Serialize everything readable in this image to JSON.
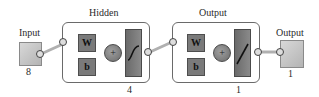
{
  "input": {
    "label": "Input",
    "size": "8"
  },
  "layers": [
    {
      "title": "Hidden",
      "weight_label": "W",
      "bias_label": "b",
      "sum_symbol": "+",
      "transfer": "sigmoid-icon",
      "size": "4"
    },
    {
      "title": "Output",
      "weight_label": "W",
      "bias_label": "b",
      "sum_symbol": "+",
      "transfer": "linear-icon",
      "size": "1"
    }
  ],
  "output": {
    "label": "Output",
    "size": "1"
  },
  "colors": {
    "block": "#7a7a7a",
    "io_box": "#c4c4c4",
    "border": "#6a6a6a"
  }
}
